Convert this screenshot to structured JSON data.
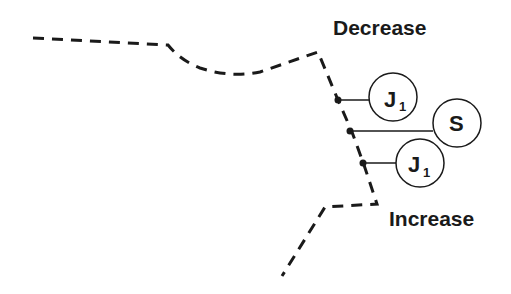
{
  "diagram": {
    "labels": {
      "top": "Decrease",
      "bottom": "Increase"
    },
    "nodes": [
      {
        "id": "j1-top",
        "main": "J",
        "sub": "1"
      },
      {
        "id": "s",
        "main": "S",
        "sub": ""
      },
      {
        "id": "j1-bottom",
        "main": "J",
        "sub": "1"
      }
    ],
    "colors": {
      "line": "#1a1a1a",
      "background": "#ffffff"
    }
  }
}
